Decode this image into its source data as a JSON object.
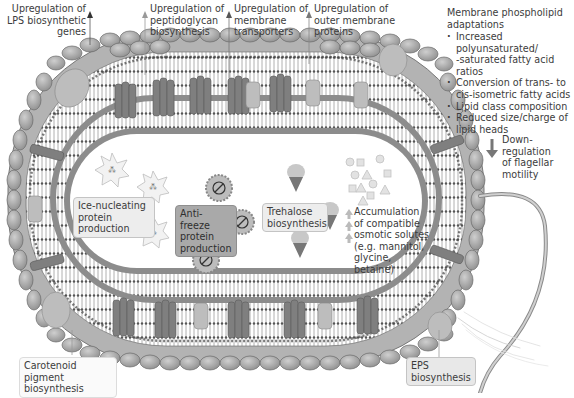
{
  "labels": {
    "lps": "Upregulation of\nLPS biosynthetic\ngenes",
    "peptidoglycan": "Upregulation of\npeptidoglycan\nbiosynthesis",
    "transporters": "Upregulation of\nmembrane\ntransporters",
    "outer_membrane": "Upregulation of\nouter membrane\nproteins",
    "flagellar": "Down-\nregulation\nof flagellar\nmotility",
    "ice_nucleating": "Ice-nucleating\nprotein\nproduction",
    "anti_freeze": "Anti-freeze\nprotein\nproduction",
    "trehalose": "Trehalose\nbiosynthesis",
    "solutes": "Accumulation\nof compatible\nosmotic solutes\n(e.g. mannitol,\nglycine,\nbetaine)",
    "carotenoid": "Carotenoid\npigment biosynthesis",
    "eps": "EPS\nbiosynthesis"
  },
  "phospholipid": {
    "title": "Membrane phospholipid\nadaptations",
    "items": [
      "Increased polyunsaturated/\n-saturated fatty acid ratios",
      "Conversion of trans- to\ncis-isometric fatty acids",
      "Lipid class composition",
      "Reduced size/charge of\nlipid heads"
    ]
  },
  "colors": {
    "outer_head": "#a6a6a6",
    "outer_head_stroke": "#6e6e6e",
    "periplasm": "#8a8a8a",
    "protein_dark": "#7a7a7a",
    "protein_light": "#b8b8b8",
    "cytoplasm": "#ffffff",
    "arrow_dark": "#555555",
    "arrow_light": "#9a9a9a"
  }
}
